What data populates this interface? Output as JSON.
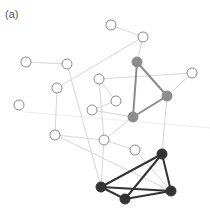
{
  "label": "(a)",
  "colors": {
    "faint_edge": "#d6d6d6",
    "very_faint_edge": "#ececec",
    "open_stroke": "#8a8a8a",
    "gray_cluster": "#8c8c8c",
    "black_cluster": "#333333"
  },
  "nodes": [
    {
      "id": "n1",
      "x": 26,
      "y": 62,
      "type": "open"
    },
    {
      "id": "n2",
      "x": 67,
      "y": 64,
      "type": "open"
    },
    {
      "id": "n3",
      "x": 111,
      "y": 25,
      "type": "open"
    },
    {
      "id": "n4",
      "x": 143,
      "y": 37,
      "type": "open"
    },
    {
      "id": "n5",
      "x": 57,
      "y": 88,
      "type": "open"
    },
    {
      "id": "n6",
      "x": 99,
      "y": 79,
      "type": "open"
    },
    {
      "id": "n7",
      "x": 192,
      "y": 73,
      "type": "open"
    },
    {
      "id": "n8",
      "x": 19,
      "y": 105,
      "type": "open"
    },
    {
      "id": "n9",
      "x": 116,
      "y": 101,
      "type": "open"
    },
    {
      "id": "n10",
      "x": 92,
      "y": 110,
      "type": "open"
    },
    {
      "id": "n11",
      "x": 55,
      "y": 135,
      "type": "open"
    },
    {
      "id": "n12",
      "x": 104,
      "y": 140,
      "type": "open"
    },
    {
      "id": "n13",
      "x": 135,
      "y": 150,
      "type": "open"
    },
    {
      "id": "g1",
      "x": 137,
      "y": 62,
      "type": "gray"
    },
    {
      "id": "g2",
      "x": 167,
      "y": 96,
      "type": "gray"
    },
    {
      "id": "g3",
      "x": 133,
      "y": 117,
      "type": "gray"
    },
    {
      "id": "b1",
      "x": 162,
      "y": 154,
      "type": "black"
    },
    {
      "id": "b2",
      "x": 101,
      "y": 187,
      "type": "black"
    },
    {
      "id": "b3",
      "x": 125,
      "y": 199,
      "type": "black"
    },
    {
      "id": "b4",
      "x": 171,
      "y": 191,
      "type": "black"
    }
  ],
  "edges": [
    {
      "from": "n1",
      "to": "n2",
      "style": "faint"
    },
    {
      "from": "n2",
      "to": "b2",
      "style": "faint"
    },
    {
      "from": "n5",
      "to": "n4",
      "style": "faint"
    },
    {
      "from": "n3",
      "to": "n4",
      "style": "faint"
    },
    {
      "from": "n4",
      "to": "g1",
      "style": "faint"
    },
    {
      "from": "n6",
      "to": "n7",
      "style": "faint"
    },
    {
      "from": "n6",
      "to": "n9",
      "style": "faint"
    },
    {
      "from": "n6",
      "to": "n12",
      "style": "faint"
    },
    {
      "from": "n10",
      "to": "g3",
      "style": "faint"
    },
    {
      "from": "n10",
      "to": "n9",
      "style": "faint"
    },
    {
      "from": "n5",
      "to": "n11",
      "style": "faint"
    },
    {
      "from": "n11",
      "to": "n12",
      "style": "faint"
    },
    {
      "from": "n11",
      "to": "b4",
      "style": "faint"
    },
    {
      "from": "n12",
      "to": "g3",
      "style": "faint"
    },
    {
      "from": "n12",
      "to": "n13",
      "style": "faint"
    },
    {
      "from": "n12",
      "to": "b2",
      "style": "faint"
    },
    {
      "from": "g2",
      "to": "n7",
      "style": "faint"
    },
    {
      "from": "g2",
      "to": "b1",
      "style": "faint"
    },
    {
      "from": "n13",
      "to": "b4",
      "style": "faint"
    },
    {
      "from": "g1",
      "to": "g2",
      "style": "gray"
    },
    {
      "from": "g1",
      "to": "g3",
      "style": "gray"
    },
    {
      "from": "g2",
      "to": "g3",
      "style": "gray"
    },
    {
      "from": "b1",
      "to": "b2",
      "style": "black"
    },
    {
      "from": "b1",
      "to": "b3",
      "style": "black"
    },
    {
      "from": "b1",
      "to": "b4",
      "style": "black"
    },
    {
      "from": "b2",
      "to": "b3",
      "style": "black"
    },
    {
      "from": "b3",
      "to": "b4",
      "style": "black"
    },
    {
      "from": "b2",
      "to": "b4",
      "style": "black"
    }
  ],
  "background_lines": [
    {
      "x1": 25,
      "y1": 112,
      "x2": 210,
      "y2": 128
    }
  ]
}
